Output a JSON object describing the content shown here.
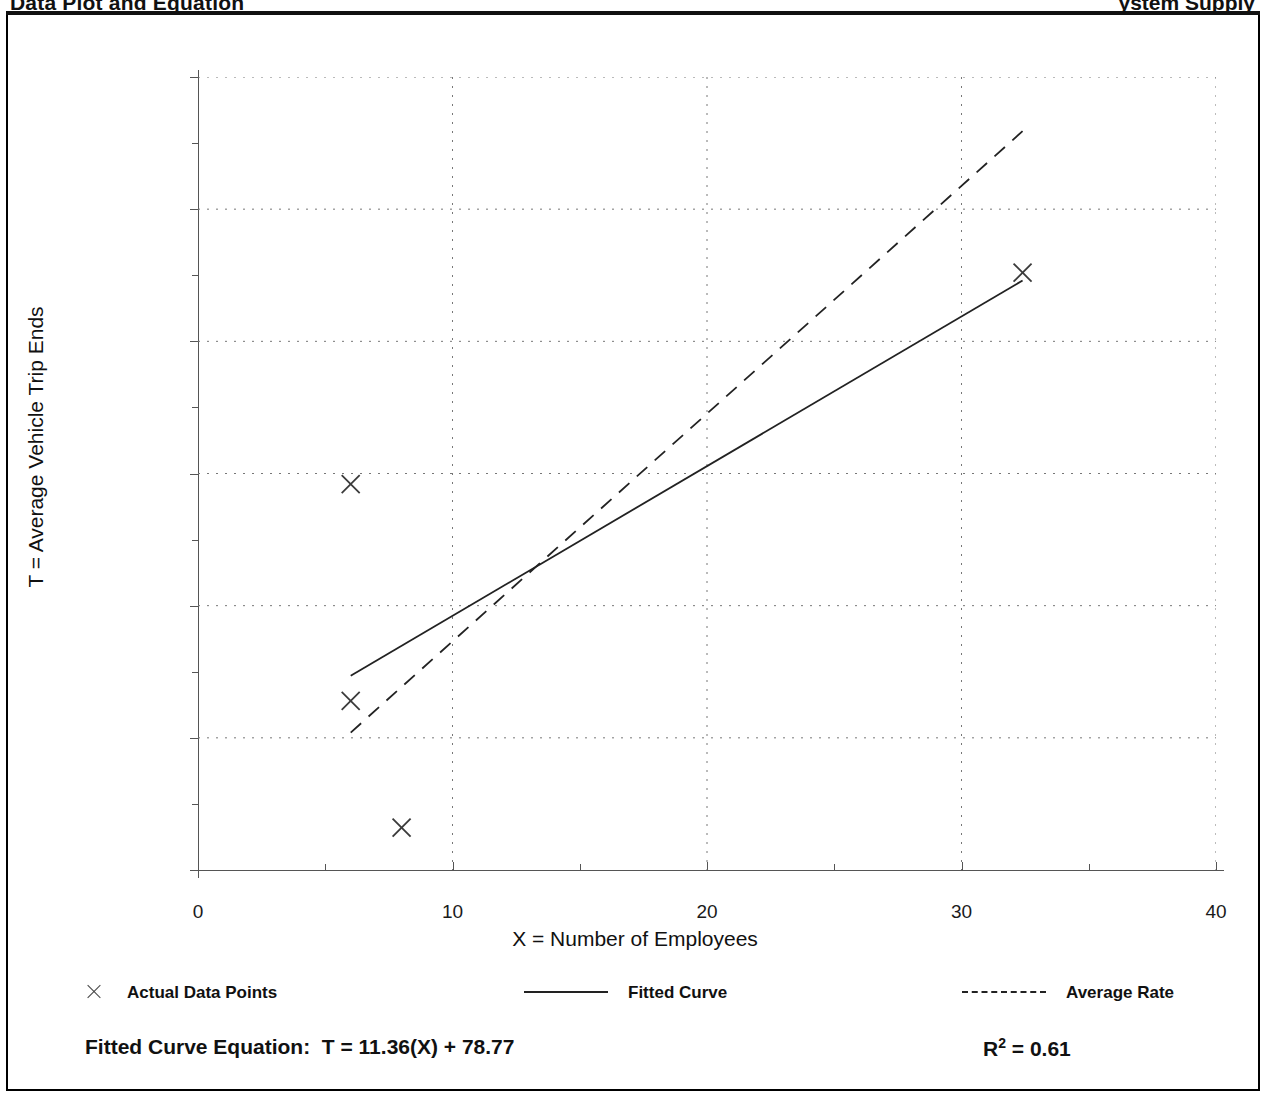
{
  "document": {
    "heading_left": "Data Plot and Equation",
    "heading_right": "ystem Supply"
  },
  "chart_data": {
    "type": "scatter",
    "title": "Data Plot and Equation",
    "xlabel": "X = Number of Employees",
    "ylabel": "T = Average Vehicle Trip Ends",
    "xlim": [
      0,
      40
    ],
    "ylim": [
      0,
      600
    ],
    "xticks": [
      0,
      10,
      20,
      30,
      40
    ],
    "xticks_minor": [
      5,
      15,
      25,
      35
    ],
    "yticks": [
      0,
      100,
      200,
      300,
      400,
      500,
      600
    ],
    "yticks_minor": [
      50,
      150,
      250,
      350,
      450,
      550
    ],
    "grid": true,
    "legend_position": "below-axes",
    "series": [
      {
        "name": "Actual Data Points",
        "type": "scatter",
        "marker": "x",
        "points": [
          {
            "x": 6,
            "y": 292
          },
          {
            "x": 6,
            "y": 128
          },
          {
            "x": 8,
            "y": 32
          },
          {
            "x": 32.4,
            "y": 452
          }
        ]
      },
      {
        "name": "Fitted Curve",
        "type": "line",
        "style": "solid",
        "equation": "T = 11.36(X) + 78.77",
        "slope": 11.36,
        "intercept": 78.77,
        "x_start": 6,
        "x_end": 32.4,
        "y_start": 147,
        "y_end": 446
      },
      {
        "name": "Average Rate",
        "type": "line",
        "style": "dashed",
        "slope": 17.4,
        "intercept": 0,
        "x_start": 6,
        "x_end": 32.4,
        "y_start": 104,
        "y_end": 559
      }
    ]
  },
  "legend": {
    "items": [
      {
        "label": "Actual Data Points",
        "marker": "x-marker"
      },
      {
        "label": "Fitted Curve",
        "marker": "solid-line"
      },
      {
        "label": "Average Rate",
        "marker": "dashed-line"
      }
    ]
  },
  "equation_row": {
    "fitted_label": "Fitted Curve Equation:",
    "fitted_equation": "T = 11.36(X) + 78.77",
    "r2_symbol": "R",
    "r2_exponent": "2",
    "r2_value": "= 0.61"
  },
  "axis_labels": {
    "y": [
      "600",
      "500",
      "400",
      "300",
      "200",
      "100",
      "0"
    ],
    "x": [
      "0",
      "10",
      "20",
      "30",
      "40"
    ]
  }
}
